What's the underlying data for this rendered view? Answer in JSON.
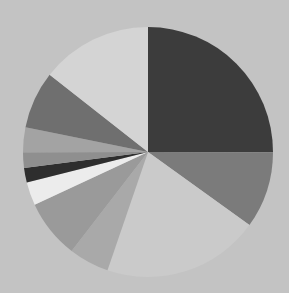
{
  "background_color": "#c3c3c3",
  "chart_data": {
    "type": "pie",
    "title": "",
    "labels_visible": false,
    "legend": "none",
    "start_angle_deg": -90,
    "direction": "clockwise",
    "center": [
      148,
      152
    ],
    "radius": 125,
    "slices": [
      {
        "value": 25.0,
        "color": "#3c3c3c"
      },
      {
        "value": 9.9,
        "color": "#7b7b7b"
      },
      {
        "value": 20.3,
        "color": "#cacaca"
      },
      {
        "value": 5.2,
        "color": "#a9a9a9"
      },
      {
        "value": 7.6,
        "color": "#9a9a9a"
      },
      {
        "value": 3.0,
        "color": "#ececec"
      },
      {
        "value": 1.9,
        "color": "#2e2e2e"
      },
      {
        "value": 2.0,
        "color": "#8f8f8f"
      },
      {
        "value": 3.2,
        "color": "#a3a3a3"
      },
      {
        "value": 7.4,
        "color": "#6f6f6f"
      },
      {
        "value": 14.4,
        "color": "#d4d4d4"
      }
    ]
  }
}
